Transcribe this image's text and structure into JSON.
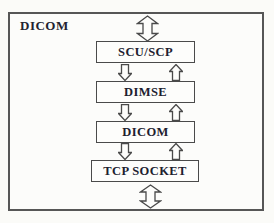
{
  "diagram": {
    "title": "DICOM",
    "layers": [
      {
        "label": "SCU/SCP"
      },
      {
        "label": "DIMSE"
      },
      {
        "label": "DICOM"
      },
      {
        "label": "TCP SOCKET"
      }
    ]
  }
}
